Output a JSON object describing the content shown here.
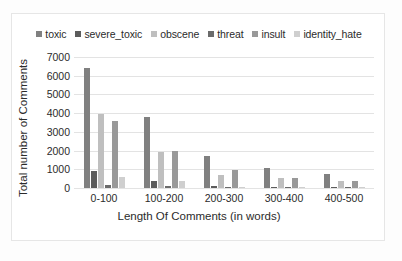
{
  "chart_data": {
    "type": "bar",
    "title": "",
    "xlabel": "Length Of Comments (in words)",
    "ylabel": "Total number of Comments",
    "categories": [
      "0-100",
      "100-200",
      "200-300",
      "300-400",
      "400-500"
    ],
    "ylim": [
      0,
      7000
    ],
    "yticks": [
      7000,
      6000,
      5000,
      4000,
      3000,
      2000,
      1000,
      0
    ],
    "grid": true,
    "legend_position": "top",
    "series": [
      {
        "name": "toxic",
        "color": "#808080",
        "values": [
          6400,
          3800,
          1720,
          1050,
          760
        ]
      },
      {
        "name": "severe_toxic",
        "color": "#5c5c5c",
        "values": [
          900,
          370,
          100,
          70,
          45
        ]
      },
      {
        "name": "obscene",
        "color": "#bfbfbf",
        "values": [
          3950,
          1940,
          720,
          510,
          390
        ]
      },
      {
        "name": "threat",
        "color": "#6b6b6b",
        "values": [
          180,
          120,
          55,
          60,
          35
        ]
      },
      {
        "name": "insult",
        "color": "#999999",
        "values": [
          3600,
          1970,
          980,
          520,
          400
        ]
      },
      {
        "name": "identity_hate",
        "color": "#cfcfcf",
        "values": [
          600,
          380,
          70,
          55,
          40
        ]
      }
    ]
  },
  "legend": {
    "items": [
      {
        "label": "toxic"
      },
      {
        "label": "severe_toxic"
      },
      {
        "label": "obscene"
      },
      {
        "label": "threat"
      },
      {
        "label": "insult"
      },
      {
        "label": "identity_hate"
      }
    ]
  }
}
